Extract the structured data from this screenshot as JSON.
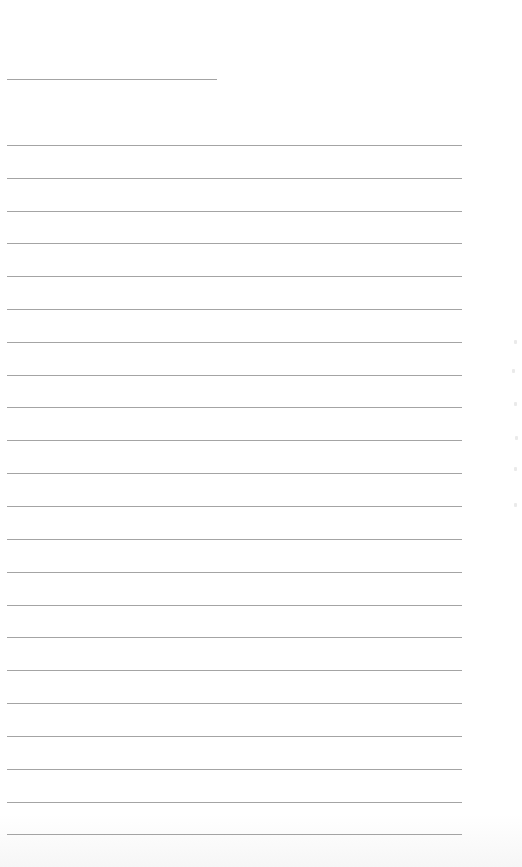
{
  "page": {
    "type": "blank-lined-sheet",
    "background_color": "#ffffff",
    "rule_color": "#a4a4a4"
  },
  "header_rule": {
    "label": "",
    "value": ""
  },
  "lines": [
    {
      "index": 1,
      "text": ""
    },
    {
      "index": 2,
      "text": ""
    },
    {
      "index": 3,
      "text": ""
    },
    {
      "index": 4,
      "text": ""
    },
    {
      "index": 5,
      "text": ""
    },
    {
      "index": 6,
      "text": ""
    },
    {
      "index": 7,
      "text": ""
    },
    {
      "index": 8,
      "text": ""
    },
    {
      "index": 9,
      "text": ""
    },
    {
      "index": 10,
      "text": ""
    },
    {
      "index": 11,
      "text": ""
    },
    {
      "index": 12,
      "text": ""
    },
    {
      "index": 13,
      "text": ""
    },
    {
      "index": 14,
      "text": ""
    },
    {
      "index": 15,
      "text": ""
    },
    {
      "index": 16,
      "text": ""
    },
    {
      "index": 17,
      "text": ""
    },
    {
      "index": 18,
      "text": ""
    },
    {
      "index": 19,
      "text": ""
    },
    {
      "index": 20,
      "text": ""
    },
    {
      "index": 21,
      "text": ""
    },
    {
      "index": 22,
      "text": ""
    }
  ]
}
